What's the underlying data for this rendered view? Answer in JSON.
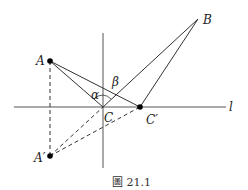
{
  "figure": {
    "caption": "圖 21.1",
    "line_label": "l",
    "points": {
      "A": {
        "label": "A",
        "x": 50,
        "y": 61
      },
      "B": {
        "label": "B",
        "x": 198,
        "y": 19
      },
      "A_prime": {
        "label": "A′",
        "x": 50,
        "y": 156
      },
      "C": {
        "label": "C",
        "x": 103,
        "y": 107
      },
      "C_prime": {
        "label": "C′",
        "x": 140,
        "y": 107
      }
    },
    "angles": {
      "alpha": "α",
      "beta": "β"
    },
    "colors": {
      "line": "#333333",
      "axis": "#555555",
      "point": "#000000"
    }
  }
}
